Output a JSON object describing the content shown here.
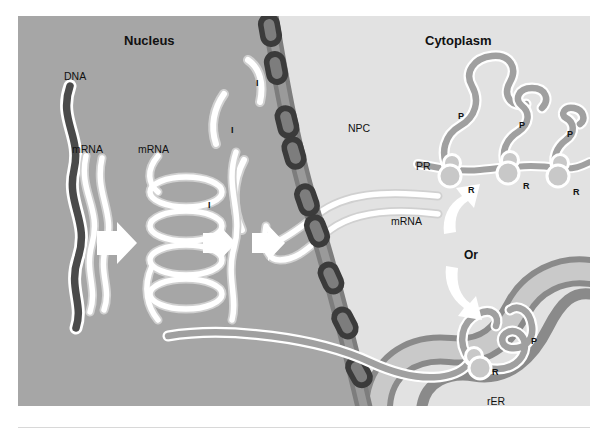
{
  "figure": {
    "title_regions": {
      "nucleus": "Nucleus",
      "cytoplasm": "Cytoplasm"
    },
    "colors": {
      "nucleus_bg": "#a6a6a6",
      "cytoplasm_bg": "#e2e2e2",
      "envelope_dark": "#3b3b3b",
      "envelope_mid": "#7d7d7d",
      "envelope_light": "#9a9a9a",
      "dna_strand": "#4a4a4a",
      "rna_strand": "#ffffff",
      "rna_outline": "#d9d9d9",
      "protein_strand": "#a0a0a0",
      "rer_membrane": "#8a8a8a",
      "rer_lumen": "#c9c9c9",
      "arrow_fill": "#ffffff",
      "text": "#111111",
      "page_bg": "#ffffff"
    },
    "labels": [
      {
        "id": "nucleus",
        "text": "Nucleus",
        "x": 106,
        "y": 18,
        "style": "heading"
      },
      {
        "id": "cytoplasm",
        "text": "Cytoplasm",
        "x": 407,
        "y": 18,
        "style": "heading"
      },
      {
        "id": "dna",
        "text": "DNA",
        "x": 46,
        "y": 55,
        "style": "tag"
      },
      {
        "id": "mrna-primary",
        "text": "mRNA",
        "x": 54,
        "y": 128,
        "style": "tag"
      },
      {
        "id": "mrna-spliced",
        "text": "mRNA",
        "x": 120,
        "y": 128,
        "style": "tag"
      },
      {
        "id": "intron-1",
        "text": "I",
        "x": 238,
        "y": 63,
        "style": "small"
      },
      {
        "id": "intron-2",
        "text": "I",
        "x": 213,
        "y": 110,
        "style": "small"
      },
      {
        "id": "intron-3",
        "text": "I",
        "x": 190,
        "y": 185,
        "style": "small"
      },
      {
        "id": "npc",
        "text": "NPC",
        "x": 330,
        "y": 107,
        "style": "tag"
      },
      {
        "id": "mrna-export",
        "text": "mRNA",
        "x": 373,
        "y": 200,
        "style": "tag"
      },
      {
        "id": "pr",
        "text": "PR",
        "x": 398,
        "y": 145,
        "style": "tag"
      },
      {
        "id": "protein-1",
        "text": "P",
        "x": 440,
        "y": 96,
        "style": "small"
      },
      {
        "id": "protein-2",
        "text": "P",
        "x": 501,
        "y": 105,
        "style": "small"
      },
      {
        "id": "protein-3",
        "text": "P",
        "x": 549,
        "y": 114,
        "style": "small"
      },
      {
        "id": "ribosome-1",
        "text": "R",
        "x": 450,
        "y": 170,
        "style": "small"
      },
      {
        "id": "ribosome-2",
        "text": "R",
        "x": 505,
        "y": 166,
        "style": "small"
      },
      {
        "id": "ribosome-3",
        "text": "R",
        "x": 555,
        "y": 172,
        "style": "small"
      },
      {
        "id": "or",
        "text": "Or",
        "x": 446,
        "y": 233,
        "style": "or"
      },
      {
        "id": "rer-ribosome",
        "text": "R",
        "x": 474,
        "y": 352,
        "style": "small"
      },
      {
        "id": "rer-protein",
        "text": "P",
        "x": 513,
        "y": 321,
        "style": "small"
      },
      {
        "id": "rer",
        "text": "rER",
        "x": 469,
        "y": 380,
        "style": "tag"
      }
    ],
    "structures": {
      "nuclear_envelope": {
        "name": "nuclear-envelope",
        "npc_count": 9,
        "description": "curved double membrane separating nucleus from cytoplasm"
      },
      "nuclear_pores": {
        "name": "nuclear-pore-complex",
        "label": "NPC",
        "count": 9
      },
      "dna": {
        "name": "dna-strand",
        "label": "DNA"
      },
      "primary_transcript": {
        "name": "primary-mrna-transcript",
        "label": "mRNA"
      },
      "spliced_transcript": {
        "name": "spliced-mrna-coil",
        "label": "mRNA",
        "loops": 4
      },
      "introns": {
        "name": "excised-intron",
        "label": "I",
        "count": 3
      },
      "polyribosome": {
        "name": "free-polyribosome",
        "label": "PR",
        "ribosomes": 3,
        "protein_label": "P",
        "ribosome_label": "R"
      },
      "rough_er": {
        "name": "rough-endoplasmic-reticulum",
        "label": "rER",
        "bound_ribosome_label": "R",
        "nascent_protein_label": "P"
      },
      "process_arrows": {
        "name": "process-arrow",
        "count": 3,
        "direction": "right"
      },
      "branch_arrows": {
        "name": "branch-arrow",
        "count": 2,
        "labels": [
          "up",
          "down"
        ],
        "connector_text": "Or"
      }
    }
  }
}
